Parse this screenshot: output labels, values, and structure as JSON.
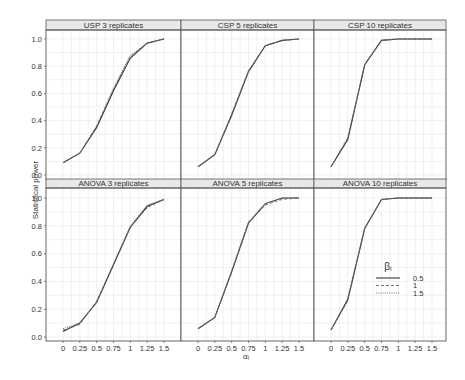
{
  "chart_data": {
    "type": "line",
    "layout": "facet_grid",
    "rows": 2,
    "cols": 3,
    "title": "",
    "xlabel": "αᵢ",
    "ylabel": "Statistical power",
    "x": [
      0,
      0.25,
      0.5,
      0.75,
      1,
      1.25,
      1.5
    ],
    "x_tick_labels": [
      "0",
      "0.25",
      "0.5",
      "0.75",
      "1",
      "1.25",
      "1.5"
    ],
    "ylim": [
      0,
      1
    ],
    "y_ticks": [
      0.0,
      0.2,
      0.4,
      0.6,
      0.8,
      1.0
    ],
    "y_tick_labels": [
      "0.0",
      "0.2",
      "0.4",
      "0.6",
      "0.8",
      "1.0"
    ],
    "grid": true,
    "legend": {
      "title": "βᵢ",
      "position": "inside bottom-right panel",
      "entries": [
        {
          "label": "0.5",
          "linestyle": "solid"
        },
        {
          "label": "1",
          "linestyle": "dashed"
        },
        {
          "label": "1.5",
          "linestyle": "dotted"
        }
      ]
    },
    "panels": [
      {
        "title": "USP 3 replicates",
        "series": [
          {
            "name": "0.5",
            "values": [
              0.09,
              0.16,
              0.35,
              0.62,
              0.86,
              0.97,
              1.0
            ]
          },
          {
            "name": "1",
            "values": [
              0.09,
              0.16,
              0.36,
              0.63,
              0.87,
              0.97,
              1.0
            ]
          },
          {
            "name": "1.5",
            "values": [
              0.09,
              0.16,
              0.36,
              0.64,
              0.88,
              0.97,
              1.0
            ]
          }
        ]
      },
      {
        "title": "CSP 5 replicates",
        "series": [
          {
            "name": "0.5",
            "values": [
              0.06,
              0.15,
              0.44,
              0.76,
              0.95,
              0.99,
              1.0
            ]
          },
          {
            "name": "1",
            "values": [
              0.06,
              0.15,
              0.45,
              0.76,
              0.95,
              0.99,
              1.0
            ]
          },
          {
            "name": "1.5",
            "values": [
              0.06,
              0.15,
              0.45,
              0.77,
              0.95,
              0.99,
              1.0
            ]
          }
        ]
      },
      {
        "title": "CSP 10 replicates",
        "series": [
          {
            "name": "0.5",
            "values": [
              0.06,
              0.26,
              0.81,
              0.99,
              1.0,
              1.0,
              1.0
            ]
          },
          {
            "name": "1",
            "values": [
              0.06,
              0.27,
              0.81,
              0.99,
              1.0,
              1.0,
              1.0
            ]
          },
          {
            "name": "1.5",
            "values": [
              0.06,
              0.28,
              0.81,
              0.99,
              1.0,
              1.0,
              1.0
            ]
          }
        ]
      },
      {
        "title": "ANOVA 3 replicates",
        "series": [
          {
            "name": "0.5",
            "values": [
              0.04,
              0.1,
              0.25,
              0.52,
              0.79,
              0.94,
              0.99
            ]
          },
          {
            "name": "1",
            "values": [
              0.05,
              0.09,
              0.26,
              0.52,
              0.79,
              0.93,
              0.99
            ]
          },
          {
            "name": "1.5",
            "values": [
              0.06,
              0.1,
              0.25,
              0.53,
              0.8,
              0.95,
              0.99
            ]
          }
        ]
      },
      {
        "title": "ANOVA 5 replicates",
        "series": [
          {
            "name": "0.5",
            "values": [
              0.06,
              0.14,
              0.47,
              0.82,
              0.96,
              1.0,
              1.0
            ]
          },
          {
            "name": "1",
            "values": [
              0.06,
              0.14,
              0.47,
              0.82,
              0.95,
              0.99,
              1.0
            ]
          },
          {
            "name": "1.5",
            "values": [
              0.06,
              0.14,
              0.48,
              0.83,
              0.96,
              1.0,
              1.0
            ]
          }
        ]
      },
      {
        "title": "ANOVA 10 replicates",
        "series": [
          {
            "name": "0.5",
            "values": [
              0.05,
              0.27,
              0.78,
              0.99,
              1.0,
              1.0,
              1.0
            ]
          },
          {
            "name": "1",
            "values": [
              0.05,
              0.26,
              0.78,
              0.99,
              1.0,
              1.0,
              1.0
            ]
          },
          {
            "name": "1.5",
            "values": [
              0.05,
              0.28,
              0.79,
              0.99,
              1.0,
              1.0,
              1.0
            ]
          }
        ]
      }
    ]
  },
  "colors": {
    "line": "#333333",
    "strip_fill": "#e8e8e8",
    "panel_border": "#555555",
    "grid": "#e6e6e6",
    "text": "#333333"
  }
}
